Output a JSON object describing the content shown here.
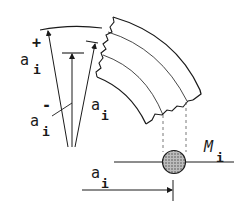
{
  "figure": {
    "type": "technical-diagram",
    "colors": {
      "line": "#1a1a1a",
      "mass_fill": "#9a9a9a",
      "background": "#ffffff"
    }
  },
  "labels": {
    "a_plus": {
      "base": "a",
      "subscript": "i",
      "superscript": "+"
    },
    "a_minus": {
      "base": "a",
      "subscript": "i",
      "superscript": "-"
    },
    "a_mid": {
      "base": "a",
      "subscript": "i"
    },
    "mass": {
      "base": "M",
      "subscript": "i"
    },
    "a_axis": {
      "base": "a",
      "subscript": "i"
    }
  }
}
